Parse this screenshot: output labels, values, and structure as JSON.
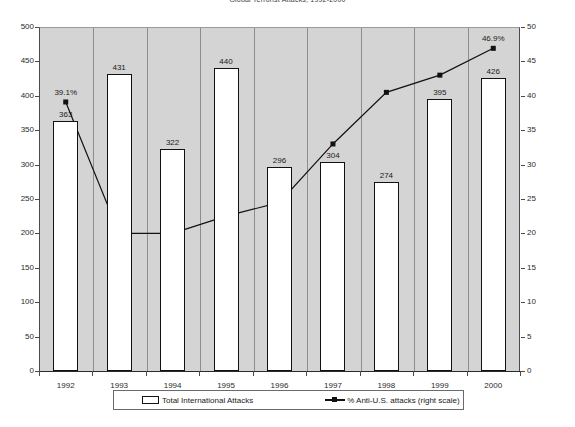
{
  "chart_data": {
    "type": "bar",
    "title": "Global Terrorist Attacks, 1992-2000",
    "xlabel": "",
    "ylabel": "",
    "categories": [
      "1992",
      "1993",
      "1994",
      "1995",
      "1996",
      "1997",
      "1998",
      "1999",
      "2000"
    ],
    "ylim": [
      0,
      500
    ],
    "y2lim": [
      0,
      50
    ],
    "yticks": [
      0,
      50,
      100,
      150,
      200,
      250,
      300,
      350,
      400,
      450,
      500
    ],
    "y2ticks": [
      0,
      5,
      10,
      15,
      20,
      25,
      30,
      35,
      40,
      45,
      50
    ],
    "grid": false,
    "legend_position": "bottom",
    "series": [
      {
        "name": "Total International Attacks",
        "axis": "left",
        "render": "bar",
        "values": [
          363,
          431,
          322,
          440,
          296,
          304,
          274,
          395,
          426
        ],
        "labels": [
          "363",
          "431",
          "322",
          "440",
          "296",
          "304",
          "274",
          "395",
          "426"
        ]
      },
      {
        "name": "% Anti-U.S. attacks (right scale)",
        "axis": "right",
        "render": "line",
        "values": [
          39.1,
          20.0,
          20.0,
          22.5,
          24.5,
          33.0,
          40.5,
          43.0,
          46.9
        ],
        "labels": [
          "39.1%",
          "",
          "",
          "",
          "",
          "",
          "",
          "",
          "46.9%"
        ]
      }
    ]
  },
  "axis": {
    "left_ticks": [
      "500",
      "450",
      "400",
      "350",
      "300",
      "250",
      "200",
      "150",
      "100",
      "50",
      "0"
    ],
    "right_ticks": [
      "50",
      "45",
      "40",
      "35",
      "30",
      "25",
      "20",
      "15",
      "10",
      "5",
      "0"
    ],
    "x_ticks": [
      "1992",
      "1993",
      "1994",
      "1995",
      "1996",
      "1997",
      "1998",
      "1999",
      "2000"
    ]
  },
  "legend": {
    "bar_label": "Total International Attacks",
    "line_label": "% Anti-U.S. attacks (right scale)"
  }
}
